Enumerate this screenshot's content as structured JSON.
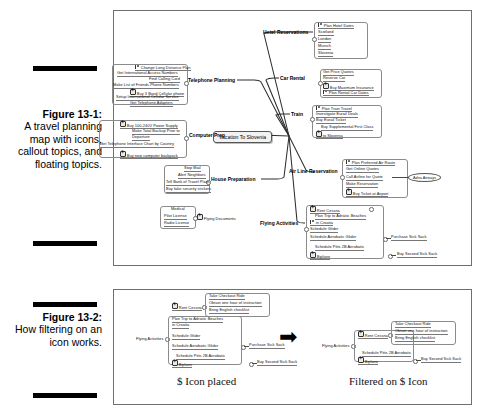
{
  "figure1": {
    "caption": {
      "number": "Figure 13-1:",
      "text": "A travel planning map with icons, callout topics, and floating topics."
    },
    "central_topic": "Vacation To Slovenia",
    "branches": [
      {
        "label": "Hotel Reservations",
        "subtopics": [
          {
            "text": "Plan Hotel Dates",
            "icon": "flag-icon"
          },
          {
            "text": "Scotland",
            "icon": ""
          },
          {
            "text": "London",
            "icon": ""
          },
          {
            "text": "Munich",
            "icon": ""
          },
          {
            "text": "Slovenia",
            "icon": ""
          }
        ]
      },
      {
        "label": "Car Rental",
        "subtopics": [
          {
            "text": "Get Price Quotes",
            "icon": ""
          },
          {
            "text": "Reserve Car",
            "icon": ""
          },
          {
            "text": "Buy Maximum Insurance",
            "icon": "dollar-icon"
          },
          {
            "text": "Plan Rental Car Dates",
            "icon": "flag-icon"
          }
        ]
      },
      {
        "label": "Train",
        "subtopics": [
          {
            "text": "Plan Train Travel",
            "icon": "flag-icon"
          },
          {
            "text": "Investigate Eurail Deals",
            "icon": ""
          },
          {
            "text": "Buy Eurail Ticket",
            "icon": ""
          },
          {
            "text": "Buy Supplemental First Class",
            "icon": ""
          },
          {
            "text": "to Slovenia",
            "icon": "dollar-icon"
          }
        ]
      },
      {
        "label": "Air Line Reservation",
        "subtopics": [
          {
            "text": "Plan Preferred Air Route",
            "icon": "flag-icon"
          },
          {
            "text": "Get Online Quotes",
            "icon": ""
          },
          {
            "text": "Call Airline for Quote",
            "icon": ""
          },
          {
            "text": "Make Reservation",
            "icon": ""
          },
          {
            "text": "Buy Ticket at Airport",
            "icon": "dollar-icon"
          }
        ],
        "callout": "Adria Airways"
      },
      {
        "label": "Flying Activities",
        "subtopics": [
          {
            "text": "Rent Cessna",
            "icon": "dollar-icon"
          },
          {
            "text": "Plan Trip to Adriatic Beaches",
            "icon": ""
          },
          {
            "text": "in Croatia",
            "icon": "flag-icon"
          },
          {
            "text": "Schedule Glider",
            "icon": ""
          },
          {
            "text": "Schedule Aerobatic Glider",
            "icon": ""
          },
          {
            "text": "Schedule Pitts 2B Aerobatic",
            "icon": ""
          },
          {
            "text": "Biplane",
            "icon": "dollar-icon"
          }
        ],
        "callouts": [
          "Purchase Sick Sack",
          "Buy Second Sick Sack"
        ]
      },
      {
        "label": "Telephone Planning",
        "subtopics": [
          {
            "text": "Change Long Distance Plan",
            "icon": "flag-icon"
          },
          {
            "text": "Get International Access Numbers",
            "icon": ""
          },
          {
            "text": "Find Calling Card",
            "icon": ""
          },
          {
            "text": "Make List of Friends Phone Numbers",
            "icon": ""
          },
          {
            "text": "Buy 3 Band Cellular phone",
            "icon": "dollar-icon"
          },
          {
            "text": "Setup International Cellular Service",
            "icon": ""
          },
          {
            "text": "Get Telephone Adapters",
            "icon": ""
          }
        ]
      },
      {
        "label": "Computer Prep",
        "subtopics": [
          {
            "text": "Buy 100-240V Power Supply",
            "icon": "dollar-icon"
          },
          {
            "text": "Make Total Backup Prior to",
            "icon": ""
          },
          {
            "text": "Departure",
            "icon": ""
          },
          {
            "text": "Get Telephone Interface Chart by Country",
            "icon": ""
          },
          {
            "text": "Buy new computer backpack",
            "icon": "dollar-icon"
          }
        ]
      },
      {
        "label": "House Preparation",
        "subtopics": [
          {
            "text": "Stop Mail",
            "icon": ""
          },
          {
            "text": "Alert Neighbors",
            "icon": ""
          },
          {
            "text": "Tell Bank of Travel Plans",
            "icon": ""
          },
          {
            "text": "Buy fake security stickers",
            "icon": ""
          }
        ]
      }
    ],
    "floating_topic": {
      "label": "Flying Documents",
      "icon": "dollar-icon",
      "subtopics": [
        {
          "text": "Medical",
          "icon": ""
        },
        {
          "text": "Pilot License",
          "icon": ""
        },
        {
          "text": "Radio License",
          "icon": ""
        }
      ]
    }
  },
  "figure2": {
    "caption": {
      "number": "Figure 13-2:",
      "text": "How filtering on an icon works."
    },
    "left_panel": {
      "label": "$ Icon placed",
      "root": "Flying Activities",
      "subtopics": [
        {
          "text": "Rent Cessna",
          "icon": "dollar-icon"
        },
        {
          "text": "Plan Trip to Adriatic Beaches",
          "icon": ""
        },
        {
          "text": "in Croatia",
          "icon": ""
        },
        {
          "text": "Schedule Glider",
          "icon": ""
        },
        {
          "text": "Schedule Aerobatic Glider",
          "icon": ""
        },
        {
          "text": "Schedule Pitts 2B Aerobatic",
          "icon": ""
        },
        {
          "text": "Biplane",
          "icon": "dollar-icon"
        }
      ],
      "cessna_children": [
        {
          "text": "Take Checkout Ride",
          "icon": ""
        },
        {
          "text": "Obtain one hour of instruction",
          "icon": ""
        },
        {
          "text": "Bring English checklist",
          "icon": ""
        }
      ],
      "callouts": [
        "Purchase Sick Sack",
        "Buy Second Sick Sack"
      ]
    },
    "right_panel": {
      "label": "Filtered on $ Icon",
      "root": "Flying Activities",
      "subtopics": [
        {
          "text": "Rent Cessna",
          "icon": "dollar-icon"
        },
        {
          "text": "Schedule Pitts 2B Aerobatic",
          "icon": ""
        },
        {
          "text": "Biplane",
          "icon": "dollar-icon"
        }
      ],
      "cessna_children": [
        {
          "text": "Take Checkout Ride",
          "icon": ""
        },
        {
          "text": "Obtain one hour of instruction",
          "icon": ""
        },
        {
          "text": "Bring English checklist",
          "icon": ""
        }
      ],
      "callouts": [
        "Buy Second Sick Sack"
      ]
    },
    "arrow": "➡"
  }
}
